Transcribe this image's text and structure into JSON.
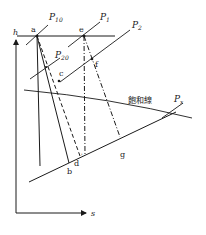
{
  "diagram": {
    "type": "h-s (Mollier) diagram, steam expansion",
    "colors": {
      "ink": "#1a1a1a",
      "background": "#ffffff"
    },
    "axes": {
      "y_label": "h",
      "x_label": "s"
    },
    "pressure_lines": {
      "P10": {
        "label": "P",
        "sub": "10"
      },
      "P1": {
        "label": "P",
        "sub": "1"
      },
      "P2": {
        "label": "P",
        "sub": "2"
      },
      "P20": {
        "label": "P",
        "sub": "20"
      },
      "Px": {
        "label": "P",
        "sub": "x"
      }
    },
    "saturation_line_label": "飽和線",
    "points": {
      "a": "a",
      "b": "b",
      "c": "c",
      "d": "d",
      "d_prime": "'",
      "e": "e",
      "f": "f",
      "g": "g"
    },
    "line_styles": {
      "a_to_vertical": "solid",
      "a_to_b": "solid",
      "a_to_d": "dashed",
      "e_to_d_vertical": "dash-dot",
      "e_to_g": "dash-dot"
    }
  }
}
